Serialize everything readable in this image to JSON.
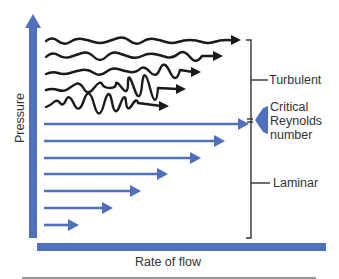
{
  "colors": {
    "axis_blue": "#4f6fbf",
    "turbulent_line": "#1a1a1a",
    "bracket": "#333333",
    "text": "#333333"
  },
  "axes": {
    "y_label": "Pressure",
    "x_label": "Rate of flow"
  },
  "labels": {
    "turbulent": "Turbulent",
    "critical_line1": "Critical",
    "critical_line2": "Reynolds",
    "critical_line3": "number",
    "laminar": "Laminar"
  },
  "turbulent_arrows": [
    {
      "y": 40,
      "x_end": 240
    },
    {
      "y": 56,
      "x_end": 222
    },
    {
      "y": 73,
      "x_end": 200
    },
    {
      "y": 90,
      "x_end": 185
    },
    {
      "y": 106,
      "x_end": 168
    }
  ],
  "laminar_arrows": [
    {
      "y": 124,
      "x_end": 248
    },
    {
      "y": 141,
      "x_end": 224
    },
    {
      "y": 158,
      "x_end": 200
    },
    {
      "y": 174,
      "x_end": 167
    },
    {
      "y": 191,
      "x_end": 140
    },
    {
      "y": 208,
      "x_end": 112
    },
    {
      "y": 225,
      "x_end": 78
    }
  ]
}
